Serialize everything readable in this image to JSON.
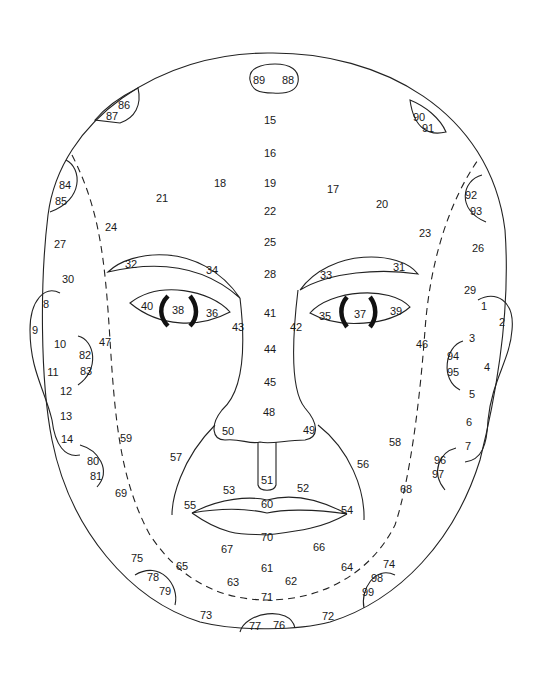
{
  "diagram": {
    "labels": [
      {
        "id": "89",
        "x": 259,
        "y": 80
      },
      {
        "id": "88",
        "x": 288,
        "y": 80
      },
      {
        "id": "15",
        "x": 270,
        "y": 120
      },
      {
        "id": "16",
        "x": 270,
        "y": 153
      },
      {
        "id": "19",
        "x": 270,
        "y": 183
      },
      {
        "id": "22",
        "x": 270,
        "y": 211
      },
      {
        "id": "25",
        "x": 270,
        "y": 242
      },
      {
        "id": "28",
        "x": 270,
        "y": 274
      },
      {
        "id": "41",
        "x": 270,
        "y": 313
      },
      {
        "id": "44",
        "x": 270,
        "y": 349
      },
      {
        "id": "45",
        "x": 270,
        "y": 382
      },
      {
        "id": "48",
        "x": 269,
        "y": 412
      },
      {
        "id": "86",
        "x": 124,
        "y": 105
      },
      {
        "id": "87",
        "x": 112,
        "y": 116
      },
      {
        "id": "90",
        "x": 419,
        "y": 117
      },
      {
        "id": "91",
        "x": 428,
        "y": 128
      },
      {
        "id": "84",
        "x": 65,
        "y": 185
      },
      {
        "id": "85",
        "x": 61,
        "y": 201
      },
      {
        "id": "92",
        "x": 471,
        "y": 195
      },
      {
        "id": "93",
        "x": 476,
        "y": 211
      },
      {
        "id": "18",
        "x": 220,
        "y": 183
      },
      {
        "id": "21",
        "x": 162,
        "y": 198
      },
      {
        "id": "17",
        "x": 333,
        "y": 189
      },
      {
        "id": "20",
        "x": 382,
        "y": 204
      },
      {
        "id": "24",
        "x": 111,
        "y": 227
      },
      {
        "id": "23",
        "x": 425,
        "y": 233
      },
      {
        "id": "27",
        "x": 60,
        "y": 244
      },
      {
        "id": "26",
        "x": 478,
        "y": 248
      },
      {
        "id": "30",
        "x": 68,
        "y": 279
      },
      {
        "id": "29",
        "x": 470,
        "y": 290
      },
      {
        "id": "32",
        "x": 131,
        "y": 264
      },
      {
        "id": "34",
        "x": 212,
        "y": 270
      },
      {
        "id": "33",
        "x": 326,
        "y": 275
      },
      {
        "id": "31",
        "x": 399,
        "y": 267
      },
      {
        "id": "40",
        "x": 147,
        "y": 306
      },
      {
        "id": "38",
        "x": 178,
        "y": 310
      },
      {
        "id": "36",
        "x": 212,
        "y": 313
      },
      {
        "id": "43",
        "x": 238,
        "y": 327
      },
      {
        "id": "42",
        "x": 296,
        "y": 327
      },
      {
        "id": "35",
        "x": 325,
        "y": 316
      },
      {
        "id": "37",
        "x": 360,
        "y": 314
      },
      {
        "id": "39",
        "x": 396,
        "y": 311
      },
      {
        "id": "8",
        "x": 46,
        "y": 304
      },
      {
        "id": "9",
        "x": 35,
        "y": 330
      },
      {
        "id": "10",
        "x": 60,
        "y": 344
      },
      {
        "id": "82",
        "x": 85,
        "y": 355
      },
      {
        "id": "83",
        "x": 86,
        "y": 371
      },
      {
        "id": "47",
        "x": 105,
        "y": 342
      },
      {
        "id": "11",
        "x": 53,
        "y": 372
      },
      {
        "id": "12",
        "x": 66,
        "y": 391
      },
      {
        "id": "13",
        "x": 66,
        "y": 416
      },
      {
        "id": "14",
        "x": 67,
        "y": 439
      },
      {
        "id": "1",
        "x": 484,
        "y": 306
      },
      {
        "id": "2",
        "x": 502,
        "y": 322
      },
      {
        "id": "3",
        "x": 472,
        "y": 338
      },
      {
        "id": "46",
        "x": 422,
        "y": 344
      },
      {
        "id": "94",
        "x": 453,
        "y": 356
      },
      {
        "id": "95",
        "x": 453,
        "y": 372
      },
      {
        "id": "4",
        "x": 487,
        "y": 367
      },
      {
        "id": "5",
        "x": 472,
        "y": 394
      },
      {
        "id": "6",
        "x": 469,
        "y": 422
      },
      {
        "id": "7",
        "x": 468,
        "y": 446
      },
      {
        "id": "59",
        "x": 126,
        "y": 438
      },
      {
        "id": "50",
        "x": 228,
        "y": 431
      },
      {
        "id": "49",
        "x": 309,
        "y": 430
      },
      {
        "id": "58",
        "x": 395,
        "y": 442
      },
      {
        "id": "57",
        "x": 176,
        "y": 457
      },
      {
        "id": "56",
        "x": 363,
        "y": 464
      },
      {
        "id": "80",
        "x": 93,
        "y": 461
      },
      {
        "id": "81",
        "x": 96,
        "y": 476
      },
      {
        "id": "96",
        "x": 440,
        "y": 460
      },
      {
        "id": "97",
        "x": 438,
        "y": 474
      },
      {
        "id": "51",
        "x": 267,
        "y": 480
      },
      {
        "id": "53",
        "x": 229,
        "y": 490
      },
      {
        "id": "52",
        "x": 303,
        "y": 488
      },
      {
        "id": "69",
        "x": 121,
        "y": 493
      },
      {
        "id": "68",
        "x": 406,
        "y": 489
      },
      {
        "id": "55",
        "x": 190,
        "y": 505
      },
      {
        "id": "60",
        "x": 267,
        "y": 504
      },
      {
        "id": "54",
        "x": 347,
        "y": 510
      },
      {
        "id": "70",
        "x": 267,
        "y": 537
      },
      {
        "id": "67",
        "x": 227,
        "y": 549
      },
      {
        "id": "66",
        "x": 319,
        "y": 547
      },
      {
        "id": "75",
        "x": 137,
        "y": 558
      },
      {
        "id": "65",
        "x": 182,
        "y": 566
      },
      {
        "id": "78",
        "x": 153,
        "y": 577
      },
      {
        "id": "79",
        "x": 165,
        "y": 591
      },
      {
        "id": "61",
        "x": 267,
        "y": 568
      },
      {
        "id": "63",
        "x": 233,
        "y": 582
      },
      {
        "id": "62",
        "x": 291,
        "y": 581
      },
      {
        "id": "64",
        "x": 347,
        "y": 567
      },
      {
        "id": "74",
        "x": 389,
        "y": 564
      },
      {
        "id": "98",
        "x": 377,
        "y": 578
      },
      {
        "id": "99",
        "x": 368,
        "y": 592
      },
      {
        "id": "71",
        "x": 267,
        "y": 597
      },
      {
        "id": "73",
        "x": 206,
        "y": 615
      },
      {
        "id": "72",
        "x": 328,
        "y": 616
      },
      {
        "id": "77",
        "x": 255,
        "y": 626
      },
      {
        "id": "76",
        "x": 279,
        "y": 625
      }
    ]
  }
}
